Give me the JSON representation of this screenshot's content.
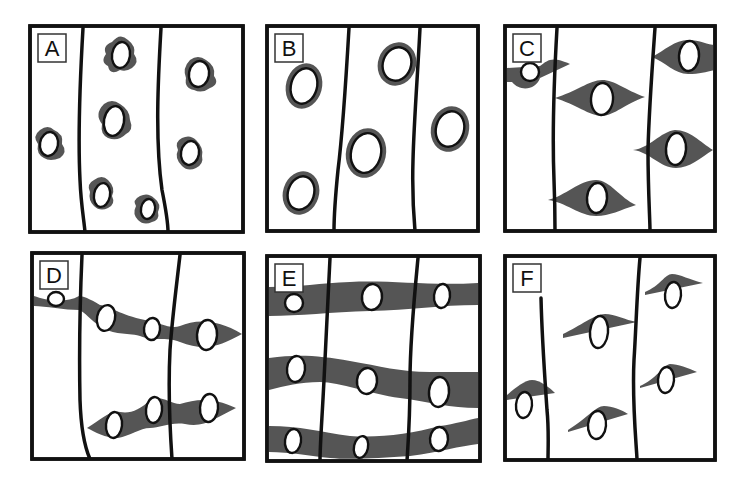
{
  "figure": {
    "width": 741,
    "height": 488,
    "colors": {
      "cytoplasm": "#555555",
      "outline": "#111111",
      "background": "#ffffff"
    },
    "panels": [
      {
        "id": "A",
        "label": "A",
        "frame": {
          "x": 30,
          "y": 26,
          "w": 213,
          "h": 206
        },
        "boundaries": [
          "M83,28 C80,80 78,140 80,180 C81,205 84,220 85,232",
          "M161,28 C158,80 155,140 162,190 C166,210 168,225 168,232"
        ],
        "cytoplasm": [
          "M112,42 q8,-10 16,-2 q8,6 6,14 q6,8 -2,14 q-6,4 -12,2 q-10,6 -12,-4 q-8,-4 -2,-12 q-4,-8 6,-12 z",
          "M190,60 q8,-6 16,0 q10,6 8,16 q6,8 -4,12 q-8,6 -16,2 q-10,-2 -8,-12 q-4,-10 4,-18 z",
          "M40,130 q8,-6 14,0 q10,4 8,14 q6,8 -2,14 q-10,4 -16,0 q-8,-4 -6,-14 q-6,-8 2,-14 z",
          "M104,104 q8,-6 16,0 q10,6 10,16 q4,10 -4,14 q-8,8 -18,4 q-8,-4 -6,-14 q-8,-10 2,-20 z",
          "M182,138 q8,-4 14,2 q8,8 6,16 q2,8 -6,12 q-8,4 -14,-2 q-8,-8 -4,-16 q-4,-8 4,-12 z",
          "M94,180 q8,-6 14,0 q8,8 4,16 q4,8 -4,12 q-8,4 -14,-2 q-6,-6 -4,-14 q-4,-8 4,-12 z",
          "M140,196 q8,-4 14,2 q8,6 4,14 q2,8 -6,10 q-8,4 -14,-2 q-6,-6 -2,-14 q-4,-6 4,-10 z"
        ],
        "nuclei": [
          {
            "cx": 121,
            "cy": 55,
            "rx": 9,
            "ry": 13,
            "rot": 8
          },
          {
            "cx": 199,
            "cy": 74,
            "rx": 10,
            "ry": 13,
            "rot": 10
          },
          {
            "cx": 49,
            "cy": 144,
            "rx": 9,
            "ry": 12,
            "rot": 10
          },
          {
            "cx": 114,
            "cy": 121,
            "rx": 10,
            "ry": 15,
            "rot": 10
          },
          {
            "cx": 190,
            "cy": 153,
            "rx": 9,
            "ry": 12,
            "rot": 10
          },
          {
            "cx": 102,
            "cy": 195,
            "rx": 8,
            "ry": 12,
            "rot": 10
          },
          {
            "cx": 148,
            "cy": 209,
            "rx": 7,
            "ry": 10,
            "rot": 10
          }
        ]
      },
      {
        "id": "B",
        "label": "B",
        "frame": {
          "x": 267,
          "y": 26,
          "w": 211,
          "h": 205
        },
        "boundaries": [
          "M349,28 C346,80 343,130 338,170 C335,200 334,220 334,231",
          "M420,28 C418,70 414,120 413,160 C412,195 414,220 415,231"
        ],
        "cytoplasm": [],
        "nuclei": [
          {
            "cx": 304,
            "cy": 86,
            "rx": 13,
            "ry": 18,
            "rot": 15,
            "ring": 5
          },
          {
            "cx": 397,
            "cy": 64,
            "rx": 14,
            "ry": 17,
            "rot": 20,
            "ring": 5
          },
          {
            "cx": 450,
            "cy": 129,
            "rx": 14,
            "ry": 18,
            "rot": 15,
            "ring": 5
          },
          {
            "cx": 366,
            "cy": 153,
            "rx": 15,
            "ry": 20,
            "rot": 12,
            "ring": 5
          },
          {
            "cx": 301,
            "cy": 193,
            "rx": 13,
            "ry": 17,
            "rot": 18,
            "ring": 5
          }
        ]
      },
      {
        "id": "C",
        "label": "C",
        "frame": {
          "x": 505,
          "y": 26,
          "w": 210,
          "h": 205
        },
        "boundaries": [
          "M557,28 C554,80 552,130 554,180 C555,205 555,220 555,231",
          "M655,28 C652,70 649,110 648,150 C648,190 650,220 650,231"
        ],
        "cytoplasm": [
          "M507,68 L540,66 C548,60 552,56 570,64 L540,78 C536,90 520,92 512,82 L507,82 z",
          "M555,98 C575,92 590,80 602,80 C615,80 625,90 645,97 C625,104 615,115 602,116 C590,116 575,104 555,98 z",
          "M652,57 C665,50 675,40 688,40 C700,40 708,45 715,45 L715,70 C705,72 700,74 688,74 C675,74 665,62 652,57 z",
          "M633,150 C650,148 660,132 675,130 C690,130 700,142 713,150 C700,158 690,168 676,168 C660,168 650,152 633,150 z",
          "M548,200 C565,196 580,180 596,180 C610,180 620,198 636,205 C620,210 610,216 596,216 C580,216 565,202 548,200 z"
        ],
        "nuclei": [
          {
            "cx": 530,
            "cy": 72,
            "rx": 9,
            "ry": 9,
            "rot": 0,
            "halfcut": true
          },
          {
            "cx": 602,
            "cy": 99,
            "rx": 11,
            "ry": 16,
            "rot": 4
          },
          {
            "cx": 689,
            "cy": 56,
            "rx": 10,
            "ry": 15,
            "rot": 4
          },
          {
            "cx": 676,
            "cy": 149,
            "rx": 10,
            "ry": 16,
            "rot": 4
          },
          {
            "cx": 597,
            "cy": 198,
            "rx": 10,
            "ry": 15,
            "rot": 4
          }
        ]
      },
      {
        "id": "D",
        "label": "D",
        "frame": {
          "x": 32,
          "y": 253,
          "w": 212,
          "h": 206
        },
        "boundaries": [
          "M82,255 C80,300 79,350 80,400 C81,430 86,450 90,459",
          "M180,255 C176,290 172,320 170,350 C168,390 170,430 172,459"
        ],
        "cytoplasm": [
          "M34,296 C45,300 65,304 79,296 C85,296 95,302 100,305 C110,306 120,315 145,320 C160,322 170,330 180,326 C195,320 215,318 242,334 C220,346 205,352 180,342 C165,336 155,342 140,336 C125,332 115,336 100,326 C90,320 85,312 79,310 C65,310 45,306 34,306 z",
          "M87,428 C100,420 110,410 120,412 C130,414 140,410 150,400 C160,394 170,404 180,404 C195,400 210,396 236,408 C215,418 205,428 185,424 C170,422 160,428 150,428 C140,428 130,436 118,438 C105,438 95,432 87,428 z"
        ],
        "nuclei": [
          {
            "cx": 56,
            "cy": 299,
            "rx": 8,
            "ry": 7,
            "rot": 0,
            "halfcut": true
          },
          {
            "cx": 106,
            "cy": 318,
            "rx": 9,
            "ry": 13,
            "rot": 12
          },
          {
            "cx": 152,
            "cy": 329,
            "rx": 8,
            "ry": 11,
            "rot": 6
          },
          {
            "cx": 207,
            "cy": 335,
            "rx": 10,
            "ry": 15,
            "rot": 4
          },
          {
            "cx": 114,
            "cy": 425,
            "rx": 8,
            "ry": 13,
            "rot": 6
          },
          {
            "cx": 154,
            "cy": 410,
            "rx": 8,
            "ry": 13,
            "rot": 6
          },
          {
            "cx": 209,
            "cy": 408,
            "rx": 9,
            "ry": 14,
            "rot": 4
          }
        ]
      },
      {
        "id": "E",
        "label": "E",
        "frame": {
          "x": 267,
          "y": 256,
          "w": 213,
          "h": 205
        },
        "boundaries": [
          "M330,258 C328,300 326,340 324,380 C322,420 320,445 320,461",
          "M418,258 C414,300 410,340 410,380 C410,420 408,445 407,461"
        ],
        "cytoplasm": [
          "M269,287 C300,287 320,283 350,282 C390,280 430,286 478,283 L478,305 C440,305 410,310 370,311 C330,312 300,316 269,316 z",
          "M269,358 C300,354 320,356 350,361 C380,366 400,372 430,372 C450,372 465,372 478,372 L478,408 C450,408 430,402 400,398 C370,394 340,382 320,382 C300,382 285,386 269,390 z",
          "M269,426 C300,426 320,432 350,436 C380,438 410,434 440,426 C455,424 468,420 478,418 L478,444 C460,446 440,452 410,456 C380,458 350,460 330,458 C310,456 290,452 269,452 z"
        ],
        "nuclei": [
          {
            "cx": 294,
            "cy": 303,
            "rx": 9,
            "ry": 9,
            "rot": 0,
            "halfcut": true
          },
          {
            "cx": 372,
            "cy": 297,
            "rx": 10,
            "ry": 13,
            "rot": 6
          },
          {
            "cx": 442,
            "cy": 296,
            "rx": 8,
            "ry": 12,
            "rot": 6
          },
          {
            "cx": 296,
            "cy": 369,
            "rx": 9,
            "ry": 13,
            "rot": 6
          },
          {
            "cx": 367,
            "cy": 381,
            "rx": 10,
            "ry": 13,
            "rot": 6
          },
          {
            "cx": 439,
            "cy": 392,
            "rx": 10,
            "ry": 15,
            "rot": 6
          },
          {
            "cx": 293,
            "cy": 441,
            "rx": 8,
            "ry": 12,
            "rot": 8
          },
          {
            "cx": 361,
            "cy": 447,
            "rx": 7,
            "ry": 11,
            "rot": 12
          },
          {
            "cx": 439,
            "cy": 439,
            "rx": 9,
            "ry": 12,
            "rot": 4
          }
        ]
      },
      {
        "id": "F",
        "label": "F",
        "frame": {
          "x": 505,
          "y": 256,
          "w": 210,
          "h": 204
        },
        "boundaries": [
          "M541,298 C542,340 545,380 547,410 C549,430 548,450 548,459",
          "M640,258 C637,290 636,330 634,360 C632,400 636,440 637,459"
        ],
        "cytoplasm": [
          "M507,395 C515,388 525,380 532,380 C540,380 550,388 555,393 L507,400 z",
          "M563,334 C580,326 595,314 605,314 C615,314 625,320 637,322 L563,338 z",
          "M568,430 C585,420 596,406 604,406 C612,406 622,410 628,414 L568,432 z",
          "M645,292 C660,286 665,274 672,274 C680,274 690,280 703,283 L645,295 z",
          "M640,386 C655,380 665,364 670,364 C678,364 688,368 697,372 L640,388 z"
        ],
        "nuclei": [
          {
            "cx": 524,
            "cy": 405,
            "rx": 8,
            "ry": 13,
            "rot": 5
          },
          {
            "cx": 599,
            "cy": 332,
            "rx": 9,
            "ry": 16,
            "rot": 5
          },
          {
            "cx": 597,
            "cy": 425,
            "rx": 9,
            "ry": 14,
            "rot": 5
          },
          {
            "cx": 673,
            "cy": 295,
            "rx": 8,
            "ry": 13,
            "rot": 5
          },
          {
            "cx": 666,
            "cy": 380,
            "rx": 8,
            "ry": 13,
            "rot": 5
          }
        ]
      }
    ]
  }
}
